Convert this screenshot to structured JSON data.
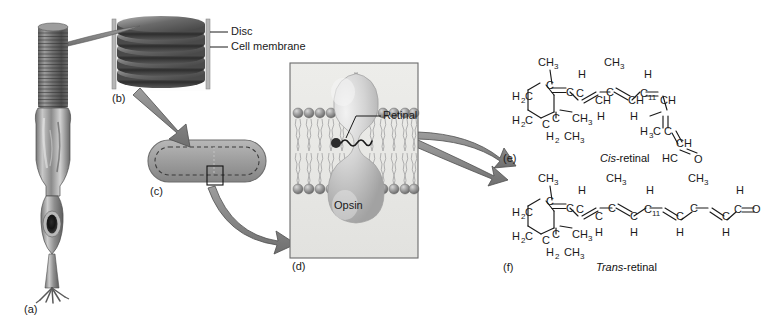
{
  "figure": {
    "panels": [
      {
        "id": "(a)",
        "name": "rod-cell",
        "caption": ""
      },
      {
        "id": "(b)",
        "name": "disc-stack",
        "caption": ""
      },
      {
        "id": "(c)",
        "name": "single-disc",
        "caption": ""
      },
      {
        "id": "(d)",
        "name": "membrane-detail",
        "caption": ""
      },
      {
        "id": "(e)",
        "name": "cis-retinal",
        "caption": "Cis-retinal"
      },
      {
        "id": "(f)",
        "name": "trans-retinal",
        "caption": "Trans-retinal"
      }
    ]
  },
  "labels": {
    "disc": "Disc",
    "cell_membrane": "Cell membrane",
    "retinal": "Retinal",
    "opsin": "Opsin"
  },
  "captions": {
    "cis_italic": "Cis",
    "cis_rest": "-retinal",
    "trans_italic": "Trans",
    "trans_rest": "-retinal"
  },
  "panel_ids": {
    "a": "(a)",
    "b": "(b)",
    "c": "(c)",
    "d": "(d)",
    "e": "(e)",
    "f": "(f)"
  },
  "chemistry": {
    "position_number": "11",
    "atoms": {
      "methyl": "CH",
      "methyl_sub": "3",
      "methylene": "H",
      "methylene_sub": "2",
      "carbon": "C",
      "hydrogen": "H",
      "oxygen": "O",
      "ch": "CH",
      "hc": "HC",
      "h2c": "H₂C",
      "h3c": "H₃C",
      "ch3": "CH₃",
      "h2": "H₂"
    },
    "cis_retinal": {
      "name": "Cis-retinal",
      "ring_substituents": [
        "CH₃",
        "CH₃",
        "CH₃"
      ],
      "chain_methyls": [
        "CH₃",
        "CH₃",
        "H₃C"
      ],
      "terminal_group": "HC=O",
      "double_bond_positions": [
        "11"
      ],
      "geometry": "11-cis (bent chain)"
    },
    "trans_retinal": {
      "name": "Trans-retinal",
      "ring_substituents": [
        "CH₃",
        "CH₃",
        "CH₃"
      ],
      "chain_methyls": [
        "CH₃",
        "CH₃",
        "CH₃"
      ],
      "terminal_group": "C=O",
      "double_bond_positions": [
        "11"
      ],
      "geometry": "all-trans (straight chain)"
    }
  },
  "colors": {
    "ink": "#1a1a1a",
    "arrow_fill": "#8c8c8c",
    "arrow_stroke": "#4a4a4a",
    "panel_bg": "#e9e9e6",
    "panel_border": "#6b6b6b",
    "disc_fill": "#a9a9a9",
    "head_group": "#9a9a9a",
    "protein": "#cfcfcf"
  }
}
